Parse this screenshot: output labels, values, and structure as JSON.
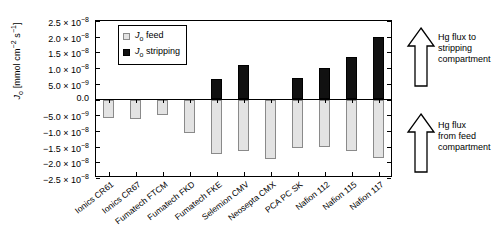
{
  "chart_data": {
    "type": "bar",
    "title": "",
    "xlabel": "",
    "ylabel": "J_o [mmol cm^-2 s^-1]",
    "ylim": [
      -2.5e-08,
      2.5e-08
    ],
    "grid": false,
    "legend_position": "top-left-inside",
    "categories": [
      "Ionics CR61",
      "Ionics CR67",
      "Fumatech FTCM",
      "Fumatech FKD",
      "Fumatech FKE",
      "Selemion CMV",
      "Neosepta CMX",
      "PCA PC SK",
      "Nafion 112",
      "Nafion 115",
      "Nafion 117"
    ],
    "series": [
      {
        "name": "J_o feed",
        "color": "#e3e3e3",
        "values": [
          -5.8e-09,
          -6.3e-09,
          -4.8e-09,
          -1.08e-08,
          -1.75e-08,
          -1.65e-08,
          -1.9e-08,
          -1.55e-08,
          -1.5e-08,
          -1.65e-08,
          -1.85e-08
        ]
      },
      {
        "name": "J_o stripping",
        "color": "#111111",
        "values": [
          0,
          0,
          0,
          0,
          6.5e-09,
          1.1e-08,
          0,
          6.8e-09,
          1e-08,
          1.35e-08,
          2e-08
        ]
      }
    ],
    "ytick_values": [
      2.5e-08,
      2e-08,
      1.5e-08,
      1e-08,
      5e-09,
      0.0,
      -5e-09,
      -1e-08,
      -1.5e-08,
      -2e-08,
      -2.5e-08
    ],
    "ytick_labels": [
      {
        "mant": "2.5 × 10",
        "exp": "−8"
      },
      {
        "mant": "2.0 × 10",
        "exp": "−8"
      },
      {
        "mant": "1.5 × 10",
        "exp": "−8"
      },
      {
        "mant": "1.0 × 10",
        "exp": "−8"
      },
      {
        "mant": "5.0 × 10",
        "exp": "−9"
      },
      {
        "mant": "0.0",
        "exp": ""
      },
      {
        "mant": "−5.0 × 10",
        "exp": "−9"
      },
      {
        "mant": "−1.0 × 10",
        "exp": "−8"
      },
      {
        "mant": "−1.5 × 10",
        "exp": "−8"
      },
      {
        "mant": "−2.0 × 10",
        "exp": "−8"
      },
      {
        "mant": "−2.5 × 10",
        "exp": "−8"
      }
    ],
    "annotations": [
      {
        "name": "flux-to-stripping",
        "text": "Hg flux to stripping compartment",
        "lines": [
          "Hg flux to",
          "stripping",
          "compartment"
        ],
        "arrow": "up"
      },
      {
        "name": "flux-from-feed",
        "text": "Hg flux from feed compartment",
        "lines": [
          "Hg flux",
          "from feed",
          "compartment"
        ],
        "arrow": "up"
      }
    ]
  },
  "legend": {
    "items": [
      {
        "label_main": "J",
        "label_sub": "o",
        "label_rest": " feed",
        "swatch": "feed"
      },
      {
        "label_main": "J",
        "label_sub": "o",
        "label_rest": " stripping",
        "swatch": "strip"
      }
    ]
  },
  "ylabel_parts": {
    "sym": "J",
    "sub": "o",
    "unit_open": " [mmol cm",
    "exp1": "−2",
    "mid": " s",
    "exp2": "−1",
    "unit_close": "]"
  }
}
